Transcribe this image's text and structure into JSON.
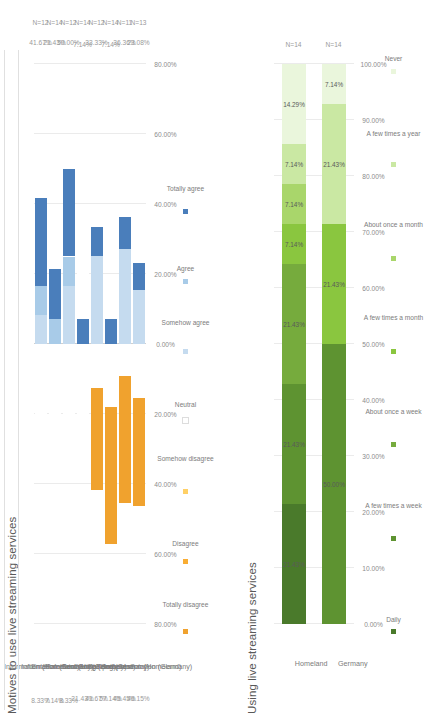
{
  "page": {
    "orientation": "rotated-90-ccw",
    "background": "#ffffff"
  },
  "chart_data": [
    {
      "id": "motives",
      "type": "bar",
      "subtype": "diverging-stacked-likert",
      "title": "Motives to use live streaming services",
      "xlabel": "",
      "ylabel": "",
      "xlim": [
        -80,
        80
      ],
      "grid": true,
      "legend_position": "bottom",
      "tick_labels": [
        "80.00%",
        "60.00%",
        "40.00%",
        "20.00%",
        "0.00%",
        "20.00%",
        "40.00%",
        "60.00%",
        "80.00%"
      ],
      "tick_values": [
        -80,
        -60,
        -40,
        -20,
        0,
        20,
        40,
        60,
        80
      ],
      "legend": [
        {
          "label": "Totally disagree",
          "color": "#f0a22e"
        },
        {
          "label": "Disagree",
          "color": "#f9ad33"
        },
        {
          "label": "Somehow disagree",
          "color": "#ffd066"
        },
        {
          "label": "Neutral",
          "color": "#ffffff"
        },
        {
          "label": "Somehow agree",
          "color": "#c5dbef"
        },
        {
          "label": "Agree",
          "color": "#a8cbe8"
        },
        {
          "label": "Totally agree",
          "color": "#4a7ebb"
        }
      ],
      "columns": [
        "Disagree total",
        "Agree total",
        "N"
      ],
      "categories": [
        "Information (Homeland)",
        "Information (Germany)",
        "Entertainment (Homeland)",
        "Entertainment (Germany)",
        "Socializing (Homeland)",
        "Socializing (Germany)",
        "Self-presentation (Homeland)",
        "Self-presentation (Germany)"
      ],
      "disagree_totals": [
        "8.33%",
        "7.14%",
        "8.33%",
        "21.43%",
        "41.67%",
        "57.14%",
        "45.45%",
        "46.15%"
      ],
      "agree_totals": [
        "41.67%",
        "21.43%",
        "50.00%",
        "7.14%",
        "33.33%",
        "7.14%",
        "36.36%",
        "23.08%"
      ],
      "n_values": [
        "N=12",
        "N=14",
        "N=12",
        "N=14",
        "N=12",
        "N=14",
        "N=11",
        "N=13"
      ],
      "rows": [
        {
          "category": "Information (Homeland)",
          "totally_disagree": 0,
          "disagree": 8.33,
          "somehow_disagree": 0,
          "neutral": 50.0,
          "somehow_agree": 8.33,
          "agree": 8.33,
          "totally_agree": 25.0
        },
        {
          "category": "Information (Germany)",
          "totally_disagree": 7.14,
          "disagree": 0,
          "somehow_disagree": 0,
          "neutral": 71.43,
          "somehow_agree": 0,
          "agree": 7.14,
          "totally_agree": 14.29
        },
        {
          "category": "Entertainment (Homeland)",
          "totally_disagree": 0,
          "disagree": 0,
          "somehow_disagree": 8.33,
          "neutral": 41.67,
          "somehow_agree": 16.67,
          "agree": 8.33,
          "totally_agree": 25.0
        },
        {
          "category": "Entertainment (Germany)",
          "totally_disagree": 7.14,
          "disagree": 7.14,
          "somehow_disagree": 7.14,
          "neutral": 71.43,
          "somehow_agree": 0,
          "agree": 0,
          "totally_agree": 7.14
        },
        {
          "category": "Socializing (Homeland)",
          "totally_disagree": 33.33,
          "disagree": 8.33,
          "somehow_disagree": 0,
          "neutral": 25.0,
          "somehow_agree": 25.0,
          "agree": 0,
          "totally_agree": 8.33
        },
        {
          "category": "Socializing (Germany)",
          "totally_disagree": 42.86,
          "disagree": 14.29,
          "somehow_disagree": 0,
          "neutral": 35.72,
          "somehow_agree": 0,
          "agree": 0,
          "totally_agree": 7.14
        },
        {
          "category": "Self-presentation (Homeland)",
          "totally_disagree": 45.45,
          "disagree": 0,
          "somehow_disagree": 0,
          "neutral": 18.18,
          "somehow_agree": 27.27,
          "agree": 0,
          "totally_agree": 9.09
        },
        {
          "category": "Self-presentation (Germany)",
          "totally_disagree": 38.46,
          "disagree": 7.69,
          "somehow_disagree": 0,
          "neutral": 30.77,
          "somehow_agree": 15.38,
          "agree": 0,
          "totally_agree": 7.69
        }
      ]
    },
    {
      "id": "usage",
      "type": "bar",
      "subtype": "stacked-100",
      "title": "Using live streaming services",
      "xlabel": "",
      "ylabel": "",
      "xlim": [
        0,
        100
      ],
      "grid": true,
      "legend_position": "bottom",
      "tick_labels": [
        "0.00%",
        "10.00%",
        "20.00%",
        "30.00%",
        "40.00%",
        "50.00%",
        "60.00%",
        "70.00%",
        "80.00%",
        "90.00%",
        "100.00%"
      ],
      "tick_values": [
        0,
        10,
        20,
        30,
        40,
        50,
        60,
        70,
        80,
        90,
        100
      ],
      "legend": [
        {
          "label": "Daily",
          "color": "#4a7a2b"
        },
        {
          "label": "A few times a week",
          "color": "#5e9331"
        },
        {
          "label": "About once a week",
          "color": "#76ab3d"
        },
        {
          "label": "A few times a month",
          "color": "#8ac63f"
        },
        {
          "label": "About once a month",
          "color": "#a9d66b"
        },
        {
          "label": "A few times a year",
          "color": "#cae8a3"
        },
        {
          "label": "Never",
          "color": "#eaf6dc"
        }
      ],
      "categories": [
        "Homeland",
        "Germany"
      ],
      "n_values": [
        "N=14",
        "N=14"
      ],
      "series": [
        {
          "name": "Daily",
          "values": [
            21.43,
            0
          ]
        },
        {
          "name": "A few times a week",
          "values": [
            21.43,
            50.0
          ]
        },
        {
          "name": "About once a week",
          "values": [
            21.43,
            0
          ]
        },
        {
          "name": "A few times a month",
          "values": [
            7.14,
            21.43
          ]
        },
        {
          "name": "About once a month",
          "values": [
            7.14,
            0
          ]
        },
        {
          "name": "A few times a year",
          "values": [
            7.14,
            21.43
          ]
        },
        {
          "name": "Never",
          "values": [
            14.29,
            7.14
          ]
        }
      ],
      "bar_labels": [
        [
          "21.43%",
          "21.43%",
          "21.43%",
          "7.14%",
          "7.14%",
          "7.14%",
          "14.29%"
        ],
        [
          "",
          "50.00%",
          "",
          "21.43%",
          "",
          "21.43%",
          "7.14%"
        ]
      ]
    }
  ]
}
